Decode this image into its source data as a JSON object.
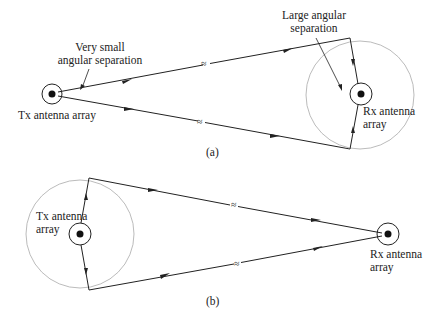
{
  "figure": {
    "panel_a": {
      "caption": "(a)",
      "tx_label": "Tx antenna array",
      "rx_label_line1": "Rx antenna",
      "rx_label_line2": "array",
      "annotation_small_line1": "Very small",
      "annotation_small_line2": "angular separation",
      "annotation_large_line1": "Large angular",
      "annotation_large_line2": "separation",
      "break_symbol": "≈"
    },
    "panel_b": {
      "caption": "(b)",
      "tx_label_line1": "Tx antenna",
      "tx_label_line2": "array",
      "rx_label_line1": "Rx antenna",
      "rx_label_line2": "array",
      "break_symbol": "≈"
    },
    "colors": {
      "line": "#222222",
      "scatter_circle": "#aaaaaa",
      "background": "#ffffff"
    }
  }
}
